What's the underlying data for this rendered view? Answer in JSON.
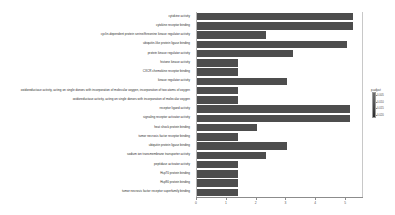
{
  "chart_data": {
    "type": "bar",
    "orientation": "horizontal",
    "title": "",
    "xlabel": "",
    "ylabel": "",
    "xlim": [
      0,
      5.6
    ],
    "grid": false,
    "bar_color": "#4d4d4d",
    "categories": [
      "cytokine activity",
      "cytokine receptor binding",
      "cyclin-dependent protein serine/threonine kinase regulator activity",
      "ubiquitin-like protein ligase binding",
      "protein kinase regulator activity",
      "histone kinase activity",
      "CXCR chemokine receptor binding",
      "kinase regulator activity",
      "oxidoreductase activity, acting on single donors with incorporation of molecular oxygen, incorporation of two atoms of oxygen",
      "oxidoreductase activity, acting on single donors with incorporation of molecular oxygen",
      "receptor ligand activity",
      "signaling receptor activator activity",
      "heat shock protein binding",
      "tumor necrosis factor receptor binding",
      "ubiquitin protein ligase binding",
      "sodium ion transmembrane transporter activity",
      "peptidase activator activity",
      "Hsp70 protein binding",
      "Hsp90 protein binding",
      "tumor necrosis factor receptor superfamily binding"
    ],
    "values": [
      5.25,
      5.25,
      2.35,
      5.05,
      3.25,
      1.4,
      1.4,
      3.05,
      1.4,
      1.4,
      5.15,
      5.15,
      2.05,
      1.4,
      3.05,
      2.35,
      1.4,
      1.4,
      1.4,
      1.4
    ],
    "xticks": [
      0,
      1,
      2,
      3,
      4,
      5
    ],
    "xticklabels": [
      "0",
      "1",
      "2",
      "3",
      "4",
      "5"
    ],
    "legend": {
      "title": "p.adjust",
      "position": "right",
      "type": "colorbar",
      "ticks": [
        "0.005",
        "0.010",
        "0.015",
        "0.020"
      ],
      "gradient_top": "#6e6e6e",
      "gradient_bottom": "#2a2a2a"
    }
  }
}
